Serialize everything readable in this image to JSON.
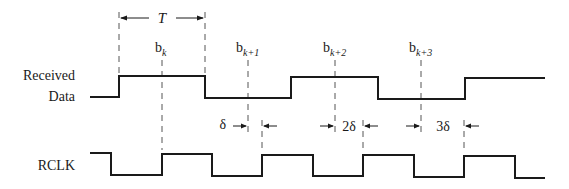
{
  "diagram": {
    "type": "timing-diagram",
    "period_label": "T",
    "signals": [
      {
        "name": "Received Data",
        "label_line1": "Received",
        "label_line2": "Data"
      },
      {
        "name": "RCLK",
        "label": "RCLK"
      }
    ],
    "bit_labels": [
      {
        "base": "b",
        "sub": "k"
      },
      {
        "base": "b",
        "sub": "k+1"
      },
      {
        "base": "b",
        "sub": "k+2"
      },
      {
        "base": "b",
        "sub": "k+3"
      }
    ],
    "offset_labels": [
      "δ",
      "2δ",
      "3δ"
    ],
    "colors": {
      "line": "#1a1a1a",
      "dash": "#555555",
      "background": "#ffffff"
    }
  }
}
